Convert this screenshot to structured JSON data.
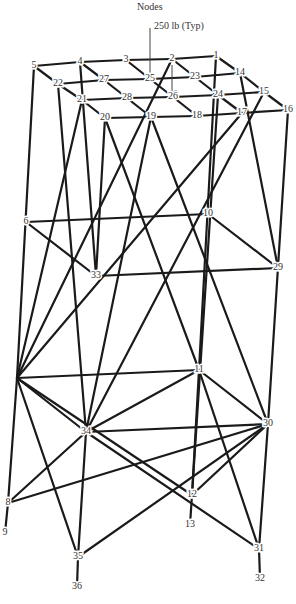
{
  "title": "Nodes",
  "load_label": "250 lb (Typ)",
  "nodes": [
    {
      "id": "1",
      "x": 216,
      "y": 56
    },
    {
      "id": "2",
      "x": 172,
      "y": 59
    },
    {
      "id": "3",
      "x": 126,
      "y": 60
    },
    {
      "id": "4",
      "x": 80,
      "y": 62
    },
    {
      "id": "5",
      "x": 34,
      "y": 66
    },
    {
      "id": "14",
      "x": 240,
      "y": 73
    },
    {
      "id": "23",
      "x": 195,
      "y": 77
    },
    {
      "id": "25",
      "x": 150,
      "y": 79
    },
    {
      "id": "27",
      "x": 104,
      "y": 80
    },
    {
      "id": "22",
      "x": 58,
      "y": 84
    },
    {
      "id": "15",
      "x": 264,
      "y": 92
    },
    {
      "id": "24",
      "x": 218,
      "y": 95
    },
    {
      "id": "26",
      "x": 173,
      "y": 97
    },
    {
      "id": "28",
      "x": 127,
      "y": 98
    },
    {
      "id": "21",
      "x": 82,
      "y": 100
    },
    {
      "id": "16",
      "x": 288,
      "y": 110
    },
    {
      "id": "17",
      "x": 242,
      "y": 113
    },
    {
      "id": "18",
      "x": 197,
      "y": 116
    },
    {
      "id": "19",
      "x": 151,
      "y": 117
    },
    {
      "id": "20",
      "x": 105,
      "y": 118
    },
    {
      "id": "6",
      "x": 26,
      "y": 222
    },
    {
      "id": "10",
      "x": 208,
      "y": 214
    },
    {
      "id": "33",
      "x": 96,
      "y": 276
    },
    {
      "id": "29",
      "x": 278,
      "y": 268
    },
    {
      "id": "7",
      "x": 17,
      "y": 378
    },
    {
      "id": "11",
      "x": 199,
      "y": 370
    },
    {
      "id": "34",
      "x": 86,
      "y": 432
    },
    {
      "id": "30",
      "x": 268,
      "y": 424
    },
    {
      "id": "8",
      "x": 8,
      "y": 503
    },
    {
      "id": "9",
      "x": 5,
      "y": 533
    },
    {
      "id": "12",
      "x": 192,
      "y": 495
    },
    {
      "id": "13",
      "x": 190,
      "y": 525
    },
    {
      "id": "35",
      "x": 78,
      "y": 557
    },
    {
      "id": "36",
      "x": 77,
      "y": 587
    },
    {
      "id": "31",
      "x": 259,
      "y": 549
    },
    {
      "id": "32",
      "x": 260,
      "y": 579
    }
  ],
  "hidden_labels": [
    "7"
  ],
  "members": [
    [
      "5",
      "4"
    ],
    [
      "4",
      "3"
    ],
    [
      "3",
      "2"
    ],
    [
      "2",
      "1"
    ],
    [
      "22",
      "27"
    ],
    [
      "27",
      "25"
    ],
    [
      "25",
      "23"
    ],
    [
      "23",
      "14"
    ],
    [
      "21",
      "28"
    ],
    [
      "28",
      "26"
    ],
    [
      "26",
      "24"
    ],
    [
      "24",
      "15"
    ],
    [
      "20",
      "19"
    ],
    [
      "19",
      "18"
    ],
    [
      "18",
      "17"
    ],
    [
      "17",
      "16"
    ],
    [
      "5",
      "22"
    ],
    [
      "22",
      "21"
    ],
    [
      "21",
      "20"
    ],
    [
      "4",
      "27"
    ],
    [
      "27",
      "28"
    ],
    [
      "28",
      "19"
    ],
    [
      "3",
      "25"
    ],
    [
      "25",
      "26"
    ],
    [
      "26",
      "18"
    ],
    [
      "2",
      "23"
    ],
    [
      "23",
      "24"
    ],
    [
      "24",
      "17"
    ],
    [
      "1",
      "14"
    ],
    [
      "14",
      "15"
    ],
    [
      "15",
      "16"
    ],
    [
      "5",
      "7"
    ],
    [
      "22",
      "34"
    ],
    [
      "4",
      "33"
    ],
    [
      "21",
      "7"
    ],
    [
      "2",
      "7"
    ],
    [
      "20",
      "33"
    ],
    [
      "20",
      "11"
    ],
    [
      "19",
      "34"
    ],
    [
      "19",
      "30"
    ],
    [
      "1",
      "11"
    ],
    [
      "14",
      "29"
    ],
    [
      "17",
      "7"
    ],
    [
      "15",
      "34"
    ],
    [
      "16",
      "30"
    ],
    [
      "24",
      "12"
    ],
    [
      "6",
      "10"
    ],
    [
      "6",
      "33"
    ],
    [
      "33",
      "29"
    ],
    [
      "10",
      "29"
    ],
    [
      "7",
      "11"
    ],
    [
      "11",
      "30"
    ],
    [
      "34",
      "30"
    ],
    [
      "7",
      "34"
    ],
    [
      "7",
      "12"
    ],
    [
      "7",
      "35"
    ],
    [
      "7",
      "8"
    ],
    [
      "11",
      "34"
    ],
    [
      "11",
      "12"
    ],
    [
      "11",
      "31"
    ],
    [
      "34",
      "8"
    ],
    [
      "34",
      "35"
    ],
    [
      "34",
      "31"
    ],
    [
      "30",
      "8"
    ],
    [
      "30",
      "12"
    ],
    [
      "30",
      "35"
    ],
    [
      "30",
      "31"
    ],
    [
      "8",
      "9"
    ],
    [
      "12",
      "13"
    ],
    [
      "35",
      "36"
    ],
    [
      "31",
      "32"
    ]
  ],
  "load_arrows": [
    {
      "x": 150,
      "y1": 28,
      "y2": 76
    },
    {
      "x": 172,
      "y1": 65,
      "y2": 93
    }
  ]
}
